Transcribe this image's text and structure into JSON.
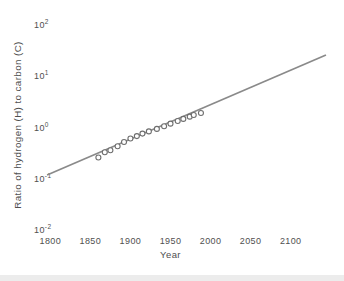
{
  "figure": {
    "background": "#ffffff",
    "bottom_strip_color": "#ececec"
  },
  "chart_data": {
    "type": "scatter",
    "title": "",
    "xlabel": "Year",
    "ylabel": "Ratio of hydrogen (H) to carbon (C)",
    "x_ticks": [
      "1800",
      "1850",
      "1900",
      "1950",
      "2000",
      "2050",
      "2100"
    ],
    "x_tick_values": [
      1800,
      1850,
      1900,
      1950,
      2000,
      2050,
      2100
    ],
    "y_ticks": [
      {
        "base": "10",
        "exp": "2",
        "value": 100
      },
      {
        "base": "10",
        "exp": "1",
        "value": 10
      },
      {
        "base": "10",
        "exp": "0",
        "value": 1
      },
      {
        "base": "10",
        "exp": "-1",
        "value": 0.1
      },
      {
        "base": "10",
        "exp": "-2",
        "value": 0.01
      }
    ],
    "xlim": [
      1788,
      2152
    ],
    "ylim": [
      0.01,
      100
    ],
    "y_scale": "log",
    "grid": false,
    "legend": null,
    "series": [
      {
        "name": "historical H/C ratio of world fuel mix",
        "type": "scatter",
        "marker": "open-circle",
        "points": [
          {
            "year": 1860,
            "ratio": 0.26
          },
          {
            "year": 1868,
            "ratio": 0.33
          },
          {
            "year": 1875,
            "ratio": 0.36
          },
          {
            "year": 1884,
            "ratio": 0.43
          },
          {
            "year": 1892,
            "ratio": 0.52
          },
          {
            "year": 1900,
            "ratio": 0.61
          },
          {
            "year": 1908,
            "ratio": 0.68
          },
          {
            "year": 1915,
            "ratio": 0.76
          },
          {
            "year": 1923,
            "ratio": 0.84
          },
          {
            "year": 1933,
            "ratio": 0.94
          },
          {
            "year": 1942,
            "ratio": 1.06
          },
          {
            "year": 1950,
            "ratio": 1.19
          },
          {
            "year": 1959,
            "ratio": 1.34
          },
          {
            "year": 1966,
            "ratio": 1.47
          },
          {
            "year": 1974,
            "ratio": 1.63
          },
          {
            "year": 1979,
            "ratio": 1.75
          },
          {
            "year": 1988,
            "ratio": 1.92
          }
        ]
      },
      {
        "name": "exponential trend line",
        "type": "line",
        "points": [
          {
            "year": 1796,
            "ratio": 0.118
          },
          {
            "year": 2144,
            "ratio": 26.0
          }
        ]
      }
    ],
    "colors": {
      "trend_line": "#8a8a8a",
      "marker_stroke": "#6e6e6e",
      "marker_fill": "#ffffff",
      "text": "#4f4f4f"
    }
  }
}
